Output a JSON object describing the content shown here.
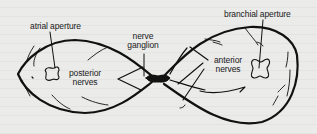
{
  "diagram": {
    "colors": {
      "ink": "#111111",
      "background": "#ebebea"
    },
    "labels": {
      "atrial_aperture": "atrial aperture",
      "branchial_aperture": "branchial aperture",
      "nerve_ganglion_line1": "nerve",
      "nerve_ganglion_line2": "ganglion",
      "posterior_nerves_line1": "posterior",
      "posterior_nerves_line2": "nerves",
      "anterior_nerves_line1": "anterior",
      "anterior_nerves_line2": "nerves"
    }
  }
}
